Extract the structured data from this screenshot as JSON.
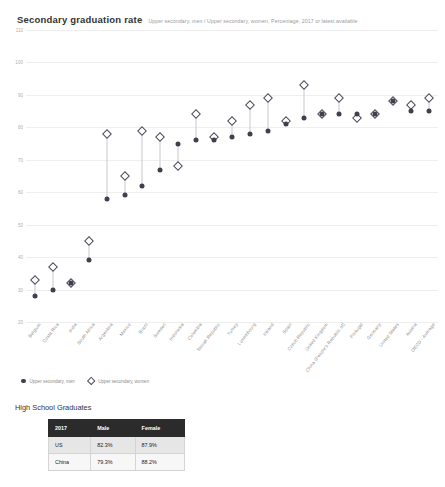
{
  "header": {
    "title": "Secondary graduation rate",
    "subtitle": "Upper secondary, men / Upper secondary, women, Percentage, 2017 or latest available"
  },
  "legend": {
    "items": [
      {
        "label": "Upper secondary, men",
        "marker": "filled-circle",
        "color": "#3f3f4e"
      },
      {
        "label": "Upper secondary, women",
        "marker": "open-diamond",
        "color": "#4a4a58"
      }
    ]
  },
  "chart_data": {
    "type": "scatter",
    "title": "Secondary graduation rate",
    "subtitle": "Upper secondary, men / Upper secondary, women, Percentage, 2017 or latest available",
    "xlabel": "",
    "ylabel": "Percentage",
    "ylim": [
      20,
      110
    ],
    "yticks": [
      110,
      100,
      90,
      80,
      70,
      60,
      50,
      40,
      30,
      20
    ],
    "grid": true,
    "legend_position": "bottom-left",
    "categories": [
      "Belgium",
      "Costa Rica",
      "India",
      "South Africa",
      "Argentina",
      "Mexico",
      "Brazil",
      "Sweden",
      "Indonesia",
      "Colombia",
      "Slovak Republic",
      "Turkey",
      "Luxembourg",
      "Ireland",
      "Spain",
      "Czech Republic",
      "United Kingdom",
      "China (People's Republic of)",
      "Portugal",
      "Germany",
      "United States",
      "Austria",
      "OECD - Average"
    ],
    "series": [
      {
        "name": "Upper secondary, men",
        "marker": "filled-circle",
        "color": "#3f3f4e",
        "values": [
          28,
          30,
          32,
          39,
          58,
          59,
          62,
          67,
          75,
          76,
          76,
          77,
          78,
          79,
          81,
          83,
          84,
          84,
          84,
          84,
          88,
          85,
          85
        ]
      },
      {
        "name": "Upper secondary, women",
        "marker": "open-diamond",
        "color": "#4a4a58",
        "values": [
          33,
          37,
          32,
          45,
          78,
          65,
          79,
          77,
          68,
          84,
          77,
          82,
          87,
          89,
          82,
          93,
          84,
          89,
          83,
          84,
          88,
          87,
          89
        ]
      }
    ]
  },
  "table": {
    "title": "High School Graduates",
    "columns": [
      "2017",
      "Male",
      "Female"
    ],
    "rows": [
      {
        "label": "US",
        "male": "82.3%",
        "female": "87.9%"
      },
      {
        "label": "China",
        "male": "79.3%",
        "female": "88.2%"
      }
    ]
  }
}
